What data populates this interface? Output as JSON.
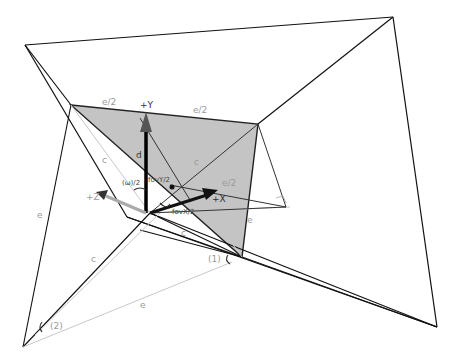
{
  "diagram": {
    "axes": {
      "y_label": "+Y",
      "x_label": "+X",
      "z_label": "+Z"
    },
    "edge_labels": {
      "e_half_left": "e/2",
      "e_half_right": "e/2",
      "d": "d",
      "c_left_upper": "c",
      "c_right_upper": "c",
      "c_left_lower": "c",
      "c_mid": "c",
      "e_left": "e",
      "e_right": "e",
      "e_bottom": "e",
      "e_half_small": "e/2"
    },
    "angle_labels": {
      "omega_half": "(ω)/2",
      "fov_y_half": "fovY/2",
      "fov_x_half": "fovX/2",
      "angle_1": "(1)",
      "angle_2": "(2)"
    },
    "colors": {
      "shade": "#c4c4c4",
      "line": "#222222",
      "light_line": "#bdbdbd",
      "label": "#9a9a9a"
    }
  }
}
